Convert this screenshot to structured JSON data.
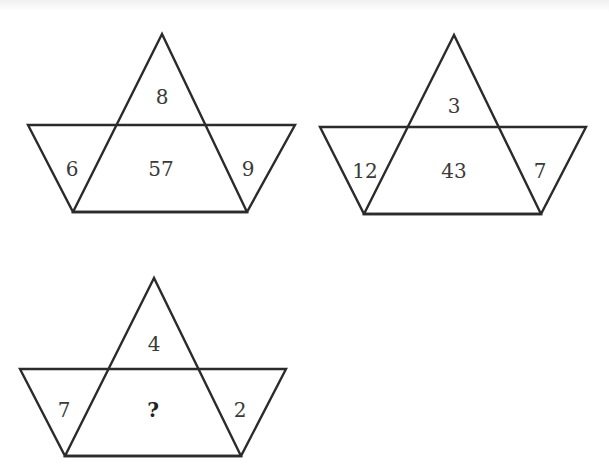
{
  "puzzle": {
    "figures": [
      {
        "id": "figure-1",
        "apex": [
          162,
          34
        ],
        "top_line": {
          "y": 125,
          "x1": 28,
          "x2": 295
        },
        "bottom_line": {
          "y": 212,
          "x1": 73,
          "x2": 247
        },
        "values": {
          "top": "8",
          "left": "6",
          "center": "57",
          "right": "9"
        },
        "label_pos": {
          "top": [
            162,
            98
          ],
          "left": [
            72,
            170
          ],
          "center": [
            161,
            170
          ],
          "right": [
            248,
            170
          ]
        }
      },
      {
        "id": "figure-2",
        "apex": [
          454,
          35
        ],
        "top_line": {
          "y": 127,
          "x1": 320,
          "x2": 586
        },
        "bottom_line": {
          "y": 214,
          "x1": 364,
          "x2": 541
        },
        "values": {
          "top": "3",
          "left": "12",
          "center": "43",
          "right": "7"
        },
        "label_pos": {
          "top": [
            454,
            107
          ],
          "left": [
            365,
            172
          ],
          "center": [
            454,
            172
          ],
          "right": [
            540,
            172
          ]
        }
      },
      {
        "id": "figure-3",
        "apex": [
          154,
          278
        ],
        "top_line": {
          "y": 369,
          "x1": 20,
          "x2": 286
        },
        "bottom_line": {
          "y": 456,
          "x1": 65,
          "x2": 241
        },
        "values": {
          "top": "4",
          "left": "7",
          "center": "?",
          "right": "2"
        },
        "label_pos": {
          "top": [
            154,
            345
          ],
          "left": [
            64,
            411
          ],
          "center": [
            153,
            411
          ],
          "right": [
            240,
            411
          ]
        }
      }
    ]
  }
}
